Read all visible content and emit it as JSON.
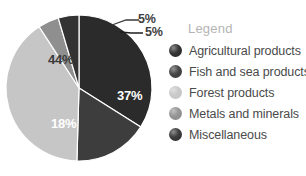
{
  "legend": {
    "title": "Legend",
    "items": [
      {
        "label": "Agricultural products",
        "color": "#2b2b2b",
        "swatch_icon": "circle-swatch-dark"
      },
      {
        "label": "Fish and sea products",
        "color": "#3d3d3d",
        "swatch_icon": "circle-swatch-dark-gray"
      },
      {
        "label": "Forest products",
        "color": "#c6c6c6",
        "swatch_icon": "circle-swatch-light-gray"
      },
      {
        "label": "Metals and minerals",
        "color": "#8f8f8f",
        "swatch_icon": "circle-swatch-medium-gray"
      },
      {
        "label": "Miscellaneous",
        "color": "#333333",
        "swatch_icon": "circle-swatch-near-black"
      }
    ]
  },
  "chart_data": {
    "type": "pie",
    "title": "",
    "categories": [
      "Agricultural products",
      "Fish and sea products",
      "Forest products",
      "Metals and minerals",
      "Miscellaneous"
    ],
    "values": [
      37,
      18,
      44,
      5,
      5
    ],
    "labels": [
      "37%",
      "18%",
      "44%",
      "5%",
      "5%"
    ],
    "colors": [
      "#2b2b2b",
      "#3d3d3d",
      "#c6c6c6",
      "#8f8f8f",
      "#333333"
    ],
    "units": "percent",
    "legend_position": "right",
    "grid": false,
    "start_angle_deg": -90,
    "slice_separator_color": "#ffffff",
    "label_placement": [
      "inside",
      "inside",
      "inside",
      "outside",
      "outside"
    ]
  }
}
